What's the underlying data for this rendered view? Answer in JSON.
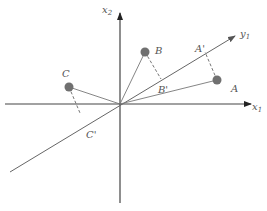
{
  "diagram": {
    "type": "pca-projection",
    "axes": {
      "x1": {
        "label": "x",
        "sub": "1"
      },
      "x2": {
        "label": "x",
        "sub": "2"
      },
      "y1": {
        "label": "y",
        "sub": "1"
      }
    },
    "points": [
      {
        "name": "A",
        "projection": "A'"
      },
      {
        "name": "B",
        "projection": "B'"
      },
      {
        "name": "C",
        "projection": "C'"
      }
    ],
    "colors": {
      "axis": "#333333",
      "line": "#666666",
      "point": "#707070",
      "label": "#555555"
    }
  }
}
